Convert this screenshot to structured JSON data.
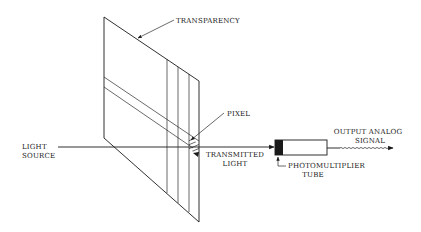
{
  "diagram": {
    "type": "schematic",
    "labels": {
      "transparency": "TRANSPARENCY",
      "pixel": "PIXEL",
      "light_source_line1": "LIGHT",
      "light_source_line2": "SOURCE",
      "transmitted_line1": "TRANSMITTED",
      "transmitted_line2": "LIGHT",
      "pmt_line1": "PHOTOMULTIPLIER",
      "pmt_line2": "TUBE",
      "output_line1": "OUTPUT ANALOG",
      "output_line2": "SIGNAL"
    },
    "components": [
      {
        "id": "light-source",
        "label": "LIGHT SOURCE"
      },
      {
        "id": "transparency",
        "label": "TRANSPARENCY"
      },
      {
        "id": "pixel",
        "label": "PIXEL"
      },
      {
        "id": "transmitted-light",
        "label": "TRANSMITTED LIGHT"
      },
      {
        "id": "photomultiplier-tube",
        "label": "PHOTOMULTIPLIER TUBE"
      },
      {
        "id": "output-signal",
        "label": "OUTPUT ANALOG SIGNAL"
      }
    ],
    "flow": [
      "light-source",
      "transparency",
      "pixel",
      "transmitted-light",
      "photomultiplier-tube",
      "output-signal"
    ],
    "colors": {
      "ink": "#1a1a1a",
      "background": "#ffffff"
    }
  }
}
